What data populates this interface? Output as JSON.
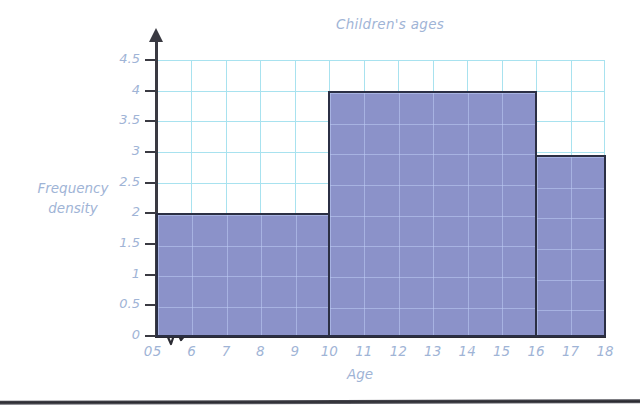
{
  "chart_data": {
    "type": "bar",
    "title": "Children's ages",
    "xlabel": "Age",
    "ylabel": "Frequency density",
    "grid": true,
    "legend": "none",
    "xlim": [
      5,
      18
    ],
    "ylim": [
      0,
      4.5
    ],
    "x_axis_break": true,
    "x_tick_labels": [
      "0",
      "5",
      "6",
      "7",
      "8",
      "9",
      "10",
      "11",
      "12",
      "13",
      "14",
      "15",
      "16",
      "17",
      "18"
    ],
    "y_tick_labels": [
      "0",
      "0.5",
      "1",
      "1.5",
      "2",
      "2.5",
      "3",
      "3.5",
      "4",
      "4.5"
    ],
    "y_tick_values": [
      0,
      0.5,
      1,
      1.5,
      2,
      2.5,
      3,
      3.5,
      4,
      4.5
    ],
    "bars": [
      {
        "label": "5-10",
        "x_start": 5,
        "x_end": 10,
        "value": 2
      },
      {
        "label": "10-16",
        "x_start": 10,
        "x_end": 16,
        "value": 4
      },
      {
        "label": "16-18",
        "x_start": 16,
        "x_end": 18,
        "value": 2.95
      }
    ],
    "colors": {
      "bar_fill": "#8b92c9",
      "bar_border": "#2b2f44",
      "grid": "#a8e2ef",
      "text": "#9fb4d6",
      "axis": "#3a3a42"
    }
  }
}
